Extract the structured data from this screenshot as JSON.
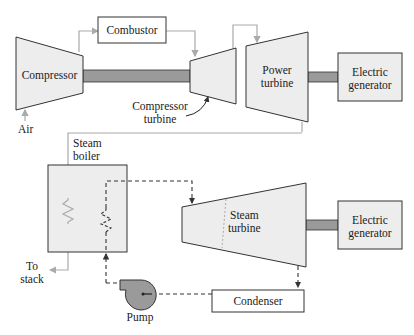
{
  "colors": {
    "outline": "#333333",
    "fill": "#ededed",
    "shaft": "#9a9a9a",
    "gas_line": "#aaaaaa",
    "steam_line": "#333333",
    "pump_fill": "#9a9a9a"
  },
  "labels": {
    "combustor": "Combustor",
    "compressor": "Compressor",
    "compressor_turbine_1": "Compressor",
    "compressor_turbine_2": "turbine",
    "power_turbine_1": "Power",
    "power_turbine_2": "turbine",
    "generator_top_1": "Electric",
    "generator_top_2": "generator",
    "air": "Air",
    "steam_boiler_1": "Steam",
    "steam_boiler_2": "boiler",
    "to_stack_1": "To",
    "to_stack_2": "stack",
    "steam_turbine_1": "Steam",
    "steam_turbine_2": "turbine",
    "generator_bottom_1": "Electric",
    "generator_bottom_2": "generator",
    "pump": "Pump",
    "condenser": "Condenser"
  }
}
